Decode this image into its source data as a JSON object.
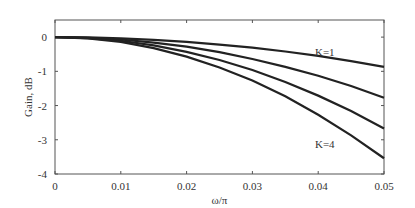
{
  "chart_data": {
    "type": "line",
    "title": "",
    "xlabel": "ω/π",
    "ylabel": "Gain, dB",
    "xlim": [
      0,
      0.05
    ],
    "ylim": [
      -4,
      0.5
    ],
    "xticks": [
      "0",
      "0.01",
      "0.02",
      "0.03",
      "0.04",
      "0.05"
    ],
    "yticks": [
      "0",
      "-1",
      "-2",
      "-3",
      "-4"
    ],
    "grid": false,
    "x": [
      0,
      0.005,
      0.01,
      0.015,
      0.02,
      0.025,
      0.03,
      0.035,
      0.04,
      0.045,
      0.05
    ],
    "series": [
      {
        "name": "K=1",
        "values": [
          0,
          -0.01,
          -0.035,
          -0.08,
          -0.14,
          -0.22,
          -0.31,
          -0.42,
          -0.55,
          -0.7,
          -0.87
        ]
      },
      {
        "name": "K=2",
        "values": [
          0,
          -0.018,
          -0.07,
          -0.16,
          -0.28,
          -0.44,
          -0.64,
          -0.87,
          -1.13,
          -1.43,
          -1.77
        ]
      },
      {
        "name": "K=3",
        "values": [
          0,
          -0.027,
          -0.107,
          -0.24,
          -0.43,
          -0.67,
          -0.96,
          -1.31,
          -1.71,
          -2.16,
          -2.67
        ]
      },
      {
        "name": "K=4",
        "values": [
          0,
          -0.035,
          -0.14,
          -0.32,
          -0.57,
          -0.89,
          -1.27,
          -1.73,
          -2.27,
          -2.87,
          -3.54
        ]
      }
    ],
    "annotations": [
      {
        "text": "K=1",
        "x": 0.041,
        "y": -0.55
      },
      {
        "text": "K=4",
        "x": 0.041,
        "y": -3.25
      }
    ]
  }
}
